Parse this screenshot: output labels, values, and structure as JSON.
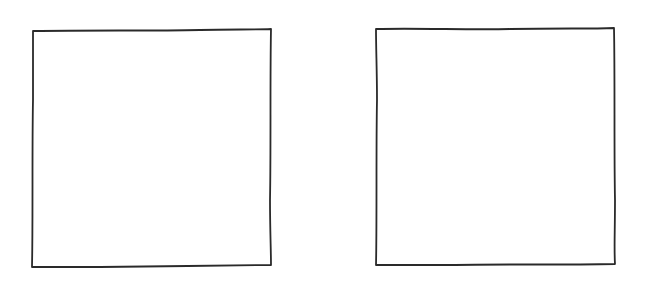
{
  "diagram": {
    "background": "#ffffff",
    "stroke_color": "#2a2a2a",
    "shapes": [
      {
        "type": "square",
        "style": "hand-drawn",
        "label": ""
      },
      {
        "type": "square",
        "style": "hand-drawn",
        "label": ""
      }
    ]
  }
}
